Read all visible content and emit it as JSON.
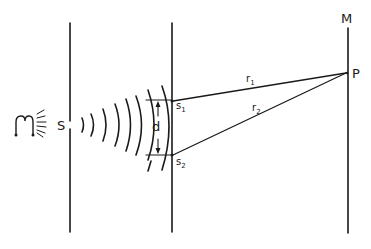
{
  "diagram": {
    "colors": {
      "ink": "#1a1a1a",
      "background": "#ffffff"
    },
    "labels": {
      "source": "S",
      "slit1": "s",
      "slit1_sub": "1",
      "slit2": "s",
      "slit2_sub": "2",
      "separation": "d",
      "screen": "M",
      "point": "P",
      "path1": "r",
      "path1_sub": "1",
      "path2": "r",
      "path2_sub": "2"
    },
    "icons": {
      "light_source": "lamp-icon"
    }
  }
}
